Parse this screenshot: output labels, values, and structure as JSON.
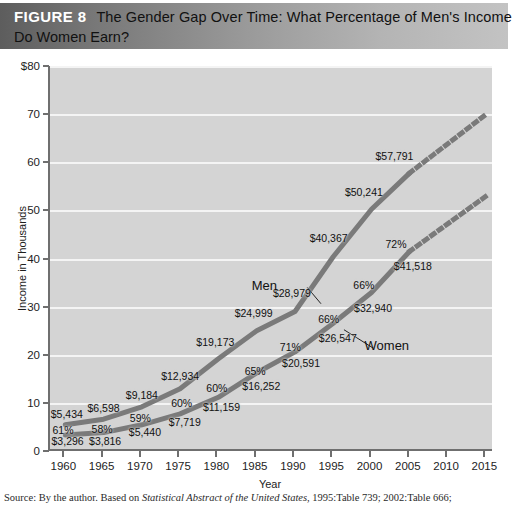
{
  "header": {
    "figure_label": "FIGURE 8",
    "title_line1": "The Gender Gap Over Time: What Percentage of Men's Income",
    "title_line2": "Do Women Earn?"
  },
  "source": {
    "prefix": "Source: By the author. Based on ",
    "italic": "Statistical Abstract of the United States",
    "suffix": ", 1995:Table 739; 2002:Table 666;"
  },
  "chart_data": {
    "type": "line",
    "title": "The Gender Gap Over Time: What Percentage of Men's Income Do Women Earn?",
    "xlabel": "Year",
    "ylabel": "Income in Thousands",
    "xlim": [
      1958,
      2016
    ],
    "ylim": [
      0,
      80
    ],
    "grid": true,
    "legend_position": "inline-annotations",
    "x_ticks": [
      "1960",
      "1965",
      "1970",
      "1975",
      "1980",
      "1985",
      "1990",
      "1995",
      "2000",
      "2005",
      "2010",
      "2015"
    ],
    "y_ticks": [
      "$80",
      "70",
      "60",
      "50",
      "40",
      "30",
      "20",
      "10",
      "0"
    ],
    "x": [
      1960,
      1965,
      1970,
      1975,
      1980,
      1985,
      1990,
      1995,
      2000,
      2005
    ],
    "projection_x": [
      2005,
      2015
    ],
    "series": [
      {
        "name": "Men",
        "values": [
          5434,
          6598,
          9184,
          12934,
          19173,
          24999,
          28979,
          40367,
          50241,
          57791
        ],
        "labels": [
          "$5,434",
          "$6,598",
          "$9,184",
          "$12,934",
          "$19,173",
          "$24,999",
          "$28,979",
          "$40,367",
          "$50,241",
          "$57,791"
        ],
        "projection_values": [
          57791,
          70000
        ]
      },
      {
        "name": "Women",
        "values": [
          3296,
          3816,
          5440,
          7719,
          11159,
          16252,
          20591,
          26547,
          32940,
          41518
        ],
        "labels": [
          "$3,296",
          "$3,816",
          "$5,440",
          "$7,719",
          "$11,159",
          "$16,252",
          "$20,591",
          "$26,547",
          "$32,940",
          "$41,518"
        ],
        "projection_values": [
          41518,
          53000
        ]
      }
    ],
    "ratio_labels": [
      "61%",
      "58%",
      "59%",
      "60%",
      "60%",
      "65%",
      "71%",
      "66%",
      "66%",
      "72%"
    ],
    "annotations": [
      {
        "text": "Men",
        "x": 1986.0,
        "y": 34.5
      },
      {
        "text": "Women",
        "x": 2002.0,
        "y": 22.0
      }
    ],
    "colors": {
      "plot_background": "#d4d4d4",
      "gridline": "#f4f4f4",
      "axis": "#6f6f6f",
      "line": "#7a7a7a",
      "text": "#111111",
      "header_dark": "#5d5d5d",
      "header_light": "#c3c3c3"
    }
  }
}
